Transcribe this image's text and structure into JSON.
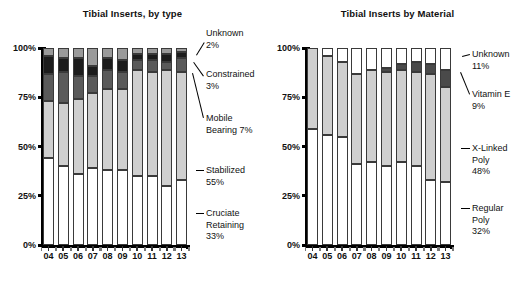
{
  "figure": {
    "width": 530,
    "height": 283,
    "background": "#ffffff"
  },
  "chart_data": [
    {
      "id": "tibial-inserts-by-type",
      "type": "bar",
      "subtype": "stacked-100-percent",
      "title": "Tibial Inserts, by type",
      "xlabel": "",
      "ylabel": "",
      "categories": [
        "04",
        "05",
        "06",
        "07",
        "08",
        "09",
        "10",
        "11",
        "12",
        "13"
      ],
      "ylim": [
        0,
        100
      ],
      "ytick_labels": [
        "0%",
        "25%",
        "50%",
        "75%",
        "100%"
      ],
      "ytick_values": [
        0,
        25,
        50,
        75,
        100
      ],
      "grid": false,
      "legend_position": "right-callouts",
      "stack_order_bottom_to_top": [
        "Cruciate Retaining",
        "Stabilized",
        "Mobile Bearing",
        "Constrained",
        "Unknown"
      ],
      "series": [
        {
          "name": "Cruciate Retaining",
          "color": "#ffffff",
          "final_label": "Cruciate\nRetaining\n33%",
          "final_value": 33,
          "values": [
            44,
            40,
            36,
            39,
            38,
            38,
            35,
            35,
            30,
            33
          ]
        },
        {
          "name": "Stabilized",
          "color": "#cfcfcf",
          "final_label": "Stabilized\n55%",
          "final_value": 55,
          "values": [
            29,
            32,
            38,
            38,
            41,
            41,
            54,
            53,
            59,
            55
          ]
        },
        {
          "name": "Mobile Bearing",
          "color": "#5a5a5a",
          "final_label": "Mobile\nBearing 7%",
          "final_value": 7,
          "values": [
            14,
            16,
            12,
            9,
            10,
            9,
            5,
            6,
            4,
            7
          ]
        },
        {
          "name": "Constrained",
          "color": "#1c1c1c",
          "final_label": "Constrained\n3%",
          "final_value": 3,
          "values": [
            9,
            7,
            9,
            5,
            6,
            6,
            3,
            3,
            4,
            3
          ]
        },
        {
          "name": "Unknown",
          "color": "#9a9a9a",
          "final_label": "Unknown\n2%",
          "final_value": 2,
          "values": [
            4,
            5,
            5,
            9,
            5,
            6,
            3,
            3,
            3,
            2
          ]
        }
      ]
    },
    {
      "id": "tibial-inserts-by-material",
      "type": "bar",
      "subtype": "stacked-100-percent",
      "title": "Tibial Inserts by Material",
      "xlabel": "",
      "ylabel": "",
      "categories": [
        "04",
        "05",
        "06",
        "07",
        "08",
        "09",
        "10",
        "11",
        "12",
        "13"
      ],
      "ylim": [
        0,
        100
      ],
      "ytick_labels": [
        "0%",
        "25%",
        "50%",
        "75%",
        "100%"
      ],
      "ytick_values": [
        0,
        25,
        50,
        75,
        100
      ],
      "grid": false,
      "legend_position": "right-callouts",
      "stack_order_bottom_to_top": [
        "Regular Poly",
        "X-Linked Poly",
        "Vitamin E",
        "Unknown"
      ],
      "series": [
        {
          "name": "Regular Poly",
          "color": "#ffffff",
          "final_label": "Regular\nPoly\n32%",
          "final_value": 32,
          "values": [
            59,
            56,
            55,
            41,
            42,
            40,
            42,
            40,
            33,
            32
          ]
        },
        {
          "name": "X-Linked Poly",
          "color": "#cfcfcf",
          "final_label": "X-Linked\nPoly\n48%",
          "final_value": 48,
          "values": [
            41,
            40,
            38,
            46,
            47,
            48,
            47,
            48,
            54,
            48
          ]
        },
        {
          "name": "Vitamin E",
          "color": "#4a4a4a",
          "final_label": "Vitamin E\n9%",
          "final_value": 9,
          "values": [
            0,
            0,
            0,
            0,
            0,
            2,
            3,
            5,
            5,
            9
          ]
        },
        {
          "name": "Unknown",
          "color": "#ffffff",
          "final_label": "Unknown\n11%",
          "final_value": 11,
          "values": [
            0,
            4,
            7,
            13,
            11,
            10,
            8,
            7,
            8,
            11
          ]
        }
      ]
    }
  ],
  "left_chart": {
    "title": "Tibial Inserts, by type",
    "ytick_labels": [
      "100%",
      "75%",
      "50%",
      "25%",
      "0%"
    ],
    "xtick_labels": [
      "04",
      "05",
      "06",
      "07",
      "08",
      "09",
      "10",
      "11",
      "12",
      "13"
    ],
    "callouts": [
      {
        "text": "Unknown\n2%"
      },
      {
        "text": "Constrained\n3%"
      },
      {
        "text": "Mobile\nBearing 7%"
      },
      {
        "text": "Stabilized\n55%"
      },
      {
        "text": "Cruciate\nRetaining\n33%"
      }
    ]
  },
  "right_chart": {
    "title": "Tibial Inserts by Material",
    "ytick_labels": [
      "100%",
      "75%",
      "50%",
      "25%",
      "0%"
    ],
    "xtick_labels": [
      "04",
      "05",
      "06",
      "07",
      "08",
      "09",
      "10",
      "11",
      "12",
      "13"
    ],
    "callouts": [
      {
        "text": "Unknown\n11%"
      },
      {
        "text": "Vitamin E\n9%"
      },
      {
        "text": "X-Linked\nPoly\n48%"
      },
      {
        "text": "Regular\nPoly\n32%"
      }
    ]
  }
}
